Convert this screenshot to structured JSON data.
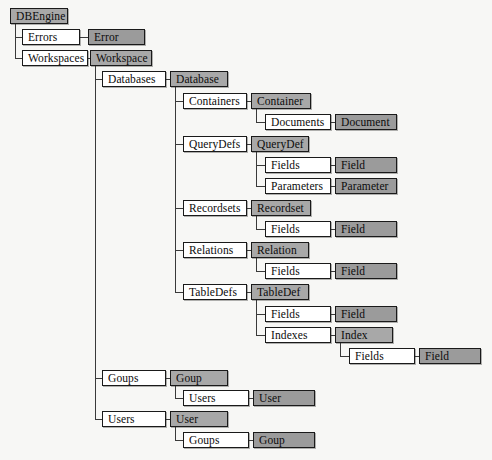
{
  "diagram": {
    "type": "tree",
    "canvas": {
      "width": 492,
      "height": 460
    },
    "colors": {
      "background": "#f7f7f5",
      "plain_fill": "#ffffff",
      "collection_fill": "#a8a8a8",
      "object_fill": "#9b9b9b",
      "border": "#1a1a1a",
      "line": "#3a3a3a"
    },
    "legend_note": "White boxes are collections; gray boxes are objects.",
    "nodes": [
      {
        "id": "dbengine",
        "label": "DBEngine",
        "style": "shaded",
        "x": 10,
        "y": 8,
        "w": 58
      },
      {
        "id": "errors",
        "label": "Errors",
        "style": "plain",
        "x": 22,
        "y": 29,
        "w": 58
      },
      {
        "id": "error",
        "label": "Error",
        "style": "shaded-dark",
        "x": 88,
        "y": 29,
        "w": 57
      },
      {
        "id": "workspaces",
        "label": "Workspaces",
        "style": "plain",
        "x": 22,
        "y": 50,
        "w": 66
      },
      {
        "id": "workspace",
        "label": "Workspace",
        "style": "shaded",
        "x": 90,
        "y": 50,
        "w": 62
      },
      {
        "id": "databases",
        "label": "Databases",
        "style": "plain",
        "x": 102,
        "y": 71,
        "w": 64
      },
      {
        "id": "database",
        "label": "Database",
        "style": "shaded",
        "x": 170,
        "y": 71,
        "w": 58
      },
      {
        "id": "containers",
        "label": "Containers",
        "style": "plain",
        "x": 183,
        "y": 93,
        "w": 64
      },
      {
        "id": "container",
        "label": "Container",
        "style": "shaded",
        "x": 251,
        "y": 93,
        "w": 60
      },
      {
        "id": "documents",
        "label": "Documents",
        "style": "plain",
        "x": 265,
        "y": 114,
        "w": 66
      },
      {
        "id": "document",
        "label": "Document",
        "style": "shaded-dark",
        "x": 335,
        "y": 114,
        "w": 62
      },
      {
        "id": "querydefs",
        "label": "QueryDefs",
        "style": "plain",
        "x": 183,
        "y": 136,
        "w": 64
      },
      {
        "id": "querydef",
        "label": "QueryDef",
        "style": "shaded",
        "x": 251,
        "y": 136,
        "w": 58
      },
      {
        "id": "qd-fields",
        "label": "Fields",
        "style": "plain",
        "x": 265,
        "y": 157,
        "w": 66
      },
      {
        "id": "qd-field",
        "label": "Field",
        "style": "shaded-dark",
        "x": 335,
        "y": 157,
        "w": 62
      },
      {
        "id": "parameters",
        "label": "Parameters",
        "style": "plain",
        "x": 265,
        "y": 178,
        "w": 66
      },
      {
        "id": "parameter",
        "label": "Parameter",
        "style": "shaded-dark",
        "x": 335,
        "y": 178,
        "w": 62
      },
      {
        "id": "recordsets",
        "label": "Recordsets",
        "style": "plain",
        "x": 183,
        "y": 200,
        "w": 64
      },
      {
        "id": "recordset",
        "label": "Recordset",
        "style": "shaded",
        "x": 251,
        "y": 200,
        "w": 60
      },
      {
        "id": "rs-fields",
        "label": "Fields",
        "style": "plain",
        "x": 265,
        "y": 221,
        "w": 66
      },
      {
        "id": "rs-field",
        "label": "Field",
        "style": "shaded-dark",
        "x": 335,
        "y": 221,
        "w": 62
      },
      {
        "id": "relations",
        "label": "Relations",
        "style": "plain",
        "x": 183,
        "y": 242,
        "w": 64
      },
      {
        "id": "relation",
        "label": "Relation",
        "style": "shaded",
        "x": 251,
        "y": 242,
        "w": 58
      },
      {
        "id": "rel-fields",
        "label": "Fields",
        "style": "plain",
        "x": 265,
        "y": 263,
        "w": 66
      },
      {
        "id": "rel-field",
        "label": "Field",
        "style": "shaded-dark",
        "x": 335,
        "y": 263,
        "w": 62
      },
      {
        "id": "tabledefs",
        "label": "TableDefs",
        "style": "plain",
        "x": 183,
        "y": 284,
        "w": 64
      },
      {
        "id": "tabledef",
        "label": "TableDef",
        "style": "shaded",
        "x": 251,
        "y": 284,
        "w": 58
      },
      {
        "id": "td-fields",
        "label": "Fields",
        "style": "plain",
        "x": 265,
        "y": 306,
        "w": 66
      },
      {
        "id": "td-field",
        "label": "Field",
        "style": "shaded-dark",
        "x": 335,
        "y": 306,
        "w": 62
      },
      {
        "id": "indexes",
        "label": "Indexes",
        "style": "plain",
        "x": 265,
        "y": 327,
        "w": 66
      },
      {
        "id": "index",
        "label": "Index",
        "style": "shaded",
        "x": 335,
        "y": 327,
        "w": 58
      },
      {
        "id": "idx-fields",
        "label": "Fields",
        "style": "plain",
        "x": 349,
        "y": 348,
        "w": 66
      },
      {
        "id": "idx-field",
        "label": "Field",
        "style": "shaded-dark",
        "x": 419,
        "y": 348,
        "w": 62
      },
      {
        "id": "goups",
        "label": "Goups",
        "style": "plain",
        "x": 102,
        "y": 370,
        "w": 64
      },
      {
        "id": "goup",
        "label": "Goup",
        "style": "shaded",
        "x": 170,
        "y": 370,
        "w": 58
      },
      {
        "id": "goup-users",
        "label": "Users",
        "style": "plain",
        "x": 183,
        "y": 390,
        "w": 66
      },
      {
        "id": "goup-user",
        "label": "User",
        "style": "shaded-dark",
        "x": 253,
        "y": 390,
        "w": 62
      },
      {
        "id": "users",
        "label": "Users",
        "style": "plain",
        "x": 102,
        "y": 411,
        "w": 64
      },
      {
        "id": "user",
        "label": "User",
        "style": "shaded",
        "x": 170,
        "y": 411,
        "w": 58
      },
      {
        "id": "user-goups",
        "label": "Goups",
        "style": "plain",
        "x": 183,
        "y": 432,
        "w": 66
      },
      {
        "id": "user-goup",
        "label": "Goup",
        "style": "shaded-dark",
        "x": 253,
        "y": 432,
        "w": 62
      }
    ],
    "edges": [
      {
        "from": "dbengine",
        "to": "errors",
        "kind": "elbow"
      },
      {
        "from": "dbengine",
        "to": "workspaces",
        "kind": "elbow"
      },
      {
        "from": "errors",
        "to": "error",
        "kind": "straight"
      },
      {
        "from": "workspaces",
        "to": "workspace",
        "kind": "straight"
      },
      {
        "from": "workspace",
        "to": "databases",
        "kind": "elbow"
      },
      {
        "from": "workspace",
        "to": "goups",
        "kind": "elbow"
      },
      {
        "from": "workspace",
        "to": "users",
        "kind": "elbow"
      },
      {
        "from": "databases",
        "to": "database",
        "kind": "straight"
      },
      {
        "from": "database",
        "to": "containers",
        "kind": "elbow"
      },
      {
        "from": "database",
        "to": "querydefs",
        "kind": "elbow"
      },
      {
        "from": "database",
        "to": "recordsets",
        "kind": "elbow"
      },
      {
        "from": "database",
        "to": "relations",
        "kind": "elbow"
      },
      {
        "from": "database",
        "to": "tabledefs",
        "kind": "elbow"
      },
      {
        "from": "containers",
        "to": "container",
        "kind": "straight"
      },
      {
        "from": "container",
        "to": "documents",
        "kind": "elbow"
      },
      {
        "from": "documents",
        "to": "document",
        "kind": "straight"
      },
      {
        "from": "querydefs",
        "to": "querydef",
        "kind": "straight"
      },
      {
        "from": "querydef",
        "to": "qd-fields",
        "kind": "elbow"
      },
      {
        "from": "querydef",
        "to": "parameters",
        "kind": "elbow"
      },
      {
        "from": "qd-fields",
        "to": "qd-field",
        "kind": "straight"
      },
      {
        "from": "parameters",
        "to": "parameter",
        "kind": "straight"
      },
      {
        "from": "recordsets",
        "to": "recordset",
        "kind": "straight"
      },
      {
        "from": "recordset",
        "to": "rs-fields",
        "kind": "elbow"
      },
      {
        "from": "rs-fields",
        "to": "rs-field",
        "kind": "straight"
      },
      {
        "from": "relations",
        "to": "relation",
        "kind": "straight"
      },
      {
        "from": "relation",
        "to": "rel-fields",
        "kind": "elbow"
      },
      {
        "from": "rel-fields",
        "to": "rel-field",
        "kind": "straight"
      },
      {
        "from": "tabledefs",
        "to": "tabledef",
        "kind": "straight"
      },
      {
        "from": "tabledef",
        "to": "td-fields",
        "kind": "elbow"
      },
      {
        "from": "tabledef",
        "to": "indexes",
        "kind": "elbow"
      },
      {
        "from": "td-fields",
        "to": "td-field",
        "kind": "straight"
      },
      {
        "from": "indexes",
        "to": "index",
        "kind": "straight"
      },
      {
        "from": "index",
        "to": "idx-fields",
        "kind": "elbow"
      },
      {
        "from": "idx-fields",
        "to": "idx-field",
        "kind": "straight"
      },
      {
        "from": "goups",
        "to": "goup",
        "kind": "straight"
      },
      {
        "from": "goup",
        "to": "goup-users",
        "kind": "elbow"
      },
      {
        "from": "goup-users",
        "to": "goup-user",
        "kind": "straight"
      },
      {
        "from": "users",
        "to": "user",
        "kind": "straight"
      },
      {
        "from": "user",
        "to": "user-goups",
        "kind": "elbow"
      },
      {
        "from": "user-goups",
        "to": "user-goup",
        "kind": "straight"
      }
    ]
  }
}
